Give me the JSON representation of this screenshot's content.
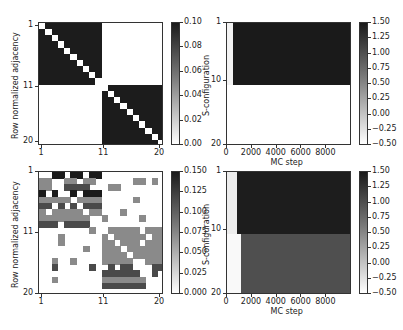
{
  "chart_data": [
    {
      "id": "top-left",
      "type": "heatmap",
      "title": "",
      "ylabel": "Row normalized adjacency",
      "xlabel": "",
      "xticks": [
        "1",
        "11",
        "20"
      ],
      "yticks": [
        "1",
        "11",
        "20"
      ],
      "colorbar": {
        "ticks": [
          "0.00",
          "0.02",
          "0.04",
          "0.06",
          "0.08",
          "0.10"
        ],
        "range": [
          0,
          0.111
        ],
        "cmap": "Greys"
      },
      "description": "Two 10x10 dense blocks (value ~0.111) on the block diagonal with zero diagonal; off-diagonal blocks zero",
      "blocks": [
        {
          "rows": [
            1,
            10
          ],
          "cols": [
            1,
            10
          ],
          "value": 0.111,
          "diagonal": 0
        },
        {
          "rows": [
            11,
            20
          ],
          "cols": [
            11,
            20
          ],
          "value": 0.111,
          "diagonal": 0
        }
      ]
    },
    {
      "id": "top-right",
      "type": "heatmap",
      "title": "",
      "ylabel": "S-configuration",
      "xlabel": "MC step",
      "xticks": [
        "0",
        "2000",
        "4000",
        "6000",
        "8000"
      ],
      "yticks": [
        "1",
        "10",
        "20"
      ],
      "xlim": [
        0,
        10000
      ],
      "colorbar": {
        "ticks": [
          "1.50",
          "1.25",
          "1.00",
          "0.75",
          "0.50",
          "0.25",
          "0.00",
          "−0.25",
          "−0.50"
        ],
        "range": [
          -0.5,
          1.5
        ],
        "cmap": "Greys"
      },
      "description": "Nodes 1-10 switch to state ~1.5 after ~500 MC steps; nodes 11-20 remain at ~-0.5",
      "regions": [
        {
          "rows": [
            1,
            10
          ],
          "x_from": 0,
          "x_to": 500,
          "value": -0.4
        },
        {
          "rows": [
            1,
            10
          ],
          "x_from": 500,
          "x_to": 10000,
          "value": 1.45
        },
        {
          "rows": [
            11,
            20
          ],
          "x_from": 0,
          "x_to": 10000,
          "value": -0.5
        }
      ]
    },
    {
      "id": "bottom-left",
      "type": "heatmap",
      "title": "",
      "ylabel": "Row normalized adjacency",
      "xlabel": "",
      "xticks": [
        "1",
        "11",
        "20"
      ],
      "yticks": [
        "1",
        "11",
        "20"
      ],
      "colorbar": {
        "ticks": [
          "0.150",
          "0.125",
          "0.100",
          "0.075",
          "0.050",
          "0.025",
          "0.000"
        ],
        "range": [
          0,
          0.167
        ],
        "cmap": "Greys"
      },
      "levels": {
        "0": 0.0,
        "1": 0.05,
        "2": 0.083,
        "3": 0.111,
        "4": 0.167
      },
      "matrix": [
        [
          0,
          0,
          4,
          4,
          0,
          4,
          4,
          0,
          4,
          4,
          0,
          0,
          0,
          0,
          0,
          0,
          0,
          0,
          0,
          0
        ],
        [
          2,
          2,
          0,
          0,
          2,
          2,
          0,
          2,
          2,
          0,
          0,
          0,
          0,
          0,
          0,
          2,
          2,
          0,
          2,
          0
        ],
        [
          2,
          2,
          0,
          0,
          3,
          3,
          3,
          3,
          0,
          0,
          0,
          2,
          2,
          0,
          0,
          0,
          0,
          0,
          0,
          0
        ],
        [
          4,
          0,
          4,
          0,
          0,
          4,
          0,
          4,
          4,
          4,
          0,
          0,
          0,
          0,
          0,
          0,
          0,
          0,
          0,
          0
        ],
        [
          2,
          2,
          2,
          2,
          2,
          0,
          2,
          2,
          2,
          2,
          0,
          0,
          0,
          0,
          0,
          2,
          0,
          0,
          0,
          0
        ],
        [
          3,
          3,
          0,
          3,
          0,
          3,
          0,
          3,
          3,
          3,
          0,
          0,
          0,
          0,
          0,
          0,
          0,
          0,
          0,
          0
        ],
        [
          2,
          0,
          2,
          2,
          2,
          2,
          2,
          0,
          2,
          2,
          0,
          0,
          0,
          2,
          0,
          0,
          0,
          0,
          0,
          0
        ],
        [
          2,
          2,
          2,
          2,
          2,
          2,
          2,
          2,
          0,
          0,
          2,
          0,
          0,
          0,
          0,
          0,
          2,
          0,
          0,
          0
        ],
        [
          3,
          3,
          3,
          0,
          3,
          3,
          3,
          3,
          0,
          0,
          0,
          0,
          0,
          0,
          0,
          0,
          0,
          0,
          0,
          0
        ],
        [
          0,
          0,
          0,
          0,
          0,
          0,
          0,
          0,
          2,
          0,
          0,
          2,
          2,
          2,
          2,
          2,
          0,
          2,
          2,
          2
        ],
        [
          0,
          0,
          0,
          2,
          0,
          0,
          0,
          0,
          0,
          0,
          2,
          0,
          2,
          2,
          2,
          2,
          2,
          0,
          2,
          2
        ],
        [
          0,
          0,
          0,
          2,
          0,
          0,
          0,
          0,
          0,
          0,
          2,
          2,
          0,
          2,
          2,
          2,
          0,
          2,
          2,
          2
        ],
        [
          0,
          0,
          0,
          0,
          0,
          0,
          0,
          2,
          0,
          0,
          2,
          2,
          2,
          0,
          2,
          2,
          2,
          2,
          2,
          2
        ],
        [
          0,
          0,
          0,
          0,
          0,
          0,
          0,
          0,
          0,
          0,
          2,
          2,
          2,
          2,
          0,
          2,
          2,
          2,
          2,
          2
        ],
        [
          0,
          0,
          2,
          0,
          0,
          2,
          0,
          0,
          0,
          0,
          2,
          2,
          2,
          2,
          2,
          0,
          0,
          2,
          2,
          2
        ],
        [
          0,
          0,
          3,
          0,
          0,
          0,
          0,
          0,
          3,
          0,
          0,
          3,
          0,
          3,
          3,
          0,
          0,
          0,
          3,
          3
        ],
        [
          0,
          0,
          0,
          0,
          0,
          0,
          0,
          0,
          0,
          0,
          3,
          3,
          3,
          3,
          3,
          3,
          0,
          0,
          3,
          0
        ],
        [
          0,
          0,
          2,
          0,
          0,
          0,
          0,
          0,
          0,
          0,
          2,
          2,
          2,
          2,
          2,
          2,
          2,
          0,
          0,
          0
        ],
        [
          0,
          0,
          0,
          0,
          0,
          0,
          0,
          0,
          0,
          0,
          3,
          3,
          3,
          3,
          3,
          3,
          3,
          0,
          0,
          0
        ],
        [
          0,
          0,
          0,
          0,
          0,
          0,
          0,
          0,
          0,
          0,
          0,
          0,
          0,
          0,
          0,
          0,
          0,
          0,
          0,
          0
        ]
      ]
    },
    {
      "id": "bottom-right",
      "type": "heatmap",
      "title": "",
      "ylabel": "S-configuration",
      "xlabel": "MC step",
      "xticks": [
        "0",
        "2000",
        "4000",
        "6000",
        "8000"
      ],
      "yticks": [
        "1",
        "10",
        "20"
      ],
      "xlim": [
        0,
        10000
      ],
      "colorbar": {
        "ticks": [
          "1.50",
          "1.25",
          "1.00",
          "0.75",
          "0.50",
          "0.25",
          "0.00",
          "−0.25",
          "−0.50"
        ],
        "range": [
          -0.5,
          1.5
        ],
        "cmap": "Greys"
      },
      "description": "Nodes 1-10 switch to ~1.45 after ~800 steps; nodes 11-20 switch to ~1.0 after ~1100 steps",
      "regions": [
        {
          "rows": [
            1,
            10
          ],
          "x_from": 0,
          "x_to": 800,
          "value": -0.35
        },
        {
          "rows": [
            1,
            10
          ],
          "x_from": 800,
          "x_to": 10000,
          "value": 1.42
        },
        {
          "rows": [
            11,
            20
          ],
          "x_from": 0,
          "x_to": 1100,
          "value": -0.45
        },
        {
          "rows": [
            11,
            20
          ],
          "x_from": 1100,
          "x_to": 10000,
          "value": 1.0
        }
      ]
    }
  ],
  "labels": {
    "adjacency_ylabel": "Row normalized adjacency",
    "config_ylabel": "S-configuration",
    "mc_xlabel": "MC step"
  },
  "colors": {
    "level0": "#ffffff",
    "level1": "#c9c9c9",
    "level2": "#8a8a8a",
    "level3": "#4a4a4a",
    "level4": "#1a1a1a",
    "tl_block": "#1c1c1c",
    "cfg_high": "#2e2e2e",
    "cfg_mid": "#5e5e5e",
    "cfg_low": "#f2f2f2"
  }
}
